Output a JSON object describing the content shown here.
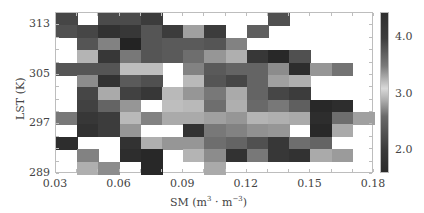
{
  "chart_data": {
    "type": "heatmap",
    "title": "",
    "xlabel": "SM (m³ · m⁻³)",
    "xlabel_parts": {
      "base": "SM (m",
      "sup1": "3",
      "mid": " · m",
      "sup2": "−3",
      "end": ")"
    },
    "ylabel": "LST (K)",
    "xlim": [
      0.03,
      0.18
    ],
    "ylim": [
      289,
      315
    ],
    "x_bin_width": 0.01,
    "y_bin_width": 2,
    "x_ticks": [
      "0.03",
      "0.06",
      "0.09",
      "0.12",
      "0.15",
      "0.18"
    ],
    "y_ticks": [
      "289",
      "297",
      "305",
      "313"
    ],
    "colorbar": {
      "ticks": [
        "4.0",
        "3.0",
        "2.0"
      ],
      "range": [
        1.6,
        4.45
      ],
      "colormap": "diverging-grayscale (dark at both ends, light near 3.1)"
    },
    "grid_note": "rows listed top (LST 313-315) to bottom (289-291); columns SM 0.03-0.18 in 0.01 bins; value = gray intensity 0-255, null = no data (white)",
    "rows": [
      [
        70,
        null,
        75,
        75,
        60,
        null,
        null,
        null,
        null,
        null,
        80,
        null,
        null,
        null,
        null
      ],
      [
        80,
        70,
        50,
        55,
        85,
        60,
        160,
        60,
        null,
        95,
        null,
        null,
        null,
        null,
        null
      ],
      [
        null,
        85,
        130,
        35,
        85,
        90,
        90,
        85,
        130,
        null,
        null,
        null,
        null,
        null,
        null
      ],
      [
        null,
        180,
        55,
        120,
        85,
        90,
        110,
        150,
        175,
        55,
        40,
        80,
        null,
        null,
        null
      ],
      [
        85,
        85,
        85,
        190,
        190,
        null,
        130,
        90,
        100,
        100,
        140,
        45,
        150,
        115,
        null
      ],
      [
        null,
        140,
        50,
        90,
        80,
        null,
        185,
        85,
        70,
        100,
        160,
        175,
        null,
        null,
        null
      ],
      [
        null,
        70,
        170,
        65,
        55,
        185,
        150,
        120,
        170,
        100,
        70,
        60,
        null,
        null,
        null
      ],
      [
        null,
        65,
        100,
        150,
        null,
        190,
        185,
        110,
        175,
        105,
        120,
        95,
        40,
        45,
        null
      ],
      [
        120,
        55,
        60,
        185,
        130,
        170,
        170,
        160,
        150,
        180,
        175,
        170,
        45,
        110,
        160
      ],
      [
        null,
        50,
        60,
        150,
        null,
        null,
        50,
        120,
        130,
        145,
        150,
        null,
        40,
        170,
        null
      ],
      [
        45,
        null,
        null,
        50,
        175,
        150,
        150,
        110,
        100,
        80,
        55,
        110,
        100,
        null,
        null
      ],
      [
        null,
        130,
        null,
        45,
        40,
        null,
        180,
        140,
        50,
        120,
        55,
        50,
        170,
        155,
        null
      ],
      [
        null,
        175,
        140,
        null,
        40,
        null,
        null,
        170,
        null,
        null,
        null,
        null,
        null,
        null,
        null
      ]
    ]
  }
}
